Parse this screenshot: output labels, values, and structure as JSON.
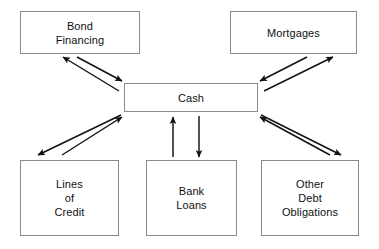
{
  "diagram": {
    "type": "flow-diagram",
    "canvas": {
      "width": 379,
      "height": 249,
      "background": "#ffffff"
    },
    "style": {
      "node_border_color": "#8a8a8a",
      "node_fill": "#ffffff",
      "text_color": "#111111",
      "arrow_color": "#111111"
    },
    "nodes": [
      {
        "id": "bond-financing",
        "label": "Bond\nFinancing"
      },
      {
        "id": "mortgages",
        "label": "Mortgages"
      },
      {
        "id": "cash",
        "label": "Cash"
      },
      {
        "id": "lines-of-credit",
        "label": "Lines\nof\nCredit"
      },
      {
        "id": "bank-loans",
        "label": "Bank\nLoans"
      },
      {
        "id": "other-debt",
        "label": "Other\nDebt\nObligations"
      }
    ],
    "edges": [
      {
        "id": "cash-to-bond-financing",
        "from": "cash",
        "to": "bond-financing",
        "direction": "up-left"
      },
      {
        "id": "bond-financing-to-cash",
        "from": "bond-financing",
        "to": "cash",
        "direction": "down-right"
      },
      {
        "id": "mortgages-to-cash",
        "from": "mortgages",
        "to": "cash",
        "direction": "down-left"
      },
      {
        "id": "cash-to-mortgages",
        "from": "cash",
        "to": "mortgages",
        "direction": "up-right"
      },
      {
        "id": "cash-to-lines-of-credit",
        "from": "cash",
        "to": "lines-of-credit",
        "direction": "down-left"
      },
      {
        "id": "lines-of-credit-to-cash",
        "from": "lines-of-credit",
        "to": "cash",
        "direction": "up-right"
      },
      {
        "id": "bank-loans-to-cash",
        "from": "bank-loans",
        "to": "cash",
        "direction": "up"
      },
      {
        "id": "cash-to-bank-loans",
        "from": "cash",
        "to": "bank-loans",
        "direction": "down"
      },
      {
        "id": "other-debt-to-cash",
        "from": "other-debt",
        "to": "cash",
        "direction": "up-left"
      },
      {
        "id": "cash-to-other-debt",
        "from": "cash",
        "to": "other-debt",
        "direction": "down-right"
      }
    ]
  }
}
